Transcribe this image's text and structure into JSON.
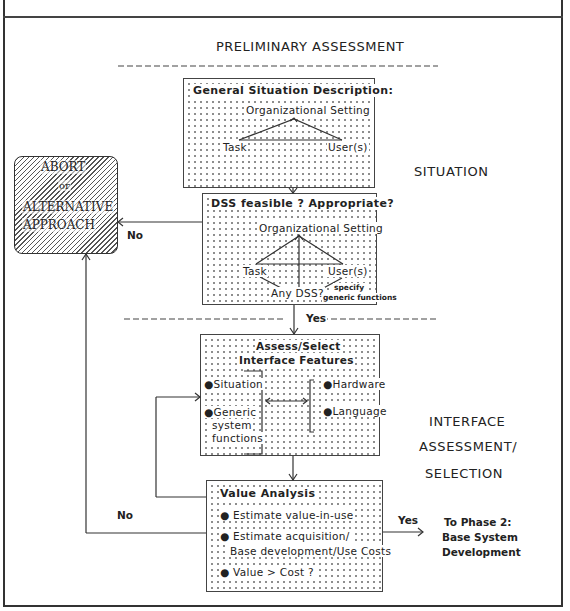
{
  "diagram": {
    "top_header": "PRELIMINARY ASSESSMENT",
    "phase_labels": {
      "situation_line1": "SITUATION",
      "situation_line2": "ANALYSIS",
      "interface_line1": "INTERFACE",
      "interface_line2": "ASSESSMENT/",
      "interface_line3": "SELECTION"
    },
    "box_general": {
      "title": "General Situation Description:",
      "org": "Organizational Setting",
      "task": "Task",
      "users": "User(s)"
    },
    "box_dss": {
      "title": "DSS feasible ? Appropriate?",
      "org": "Organizational Setting",
      "task": "Task",
      "users": "User(s)",
      "any_dss": "Any DSS?",
      "specify_line1": "specify",
      "specify_line2": "generic functions"
    },
    "box_abort": {
      "line1": "ABORT",
      "line2": "or",
      "line3": "ALTERNATIVE",
      "line4": "APPROACH"
    },
    "box_interface": {
      "title_line1": "Assess/Select",
      "title_line2": "Interface Features",
      "left_items": [
        "Situation",
        "Generic",
        "system",
        "functions"
      ],
      "right_items": [
        "Hardware",
        "Language"
      ]
    },
    "box_value": {
      "title": "Value Analysis",
      "items": [
        "Estimate value-in-use",
        "Estimate acquisition/",
        "Base development/Use Costs",
        "Value > Cost ?"
      ]
    },
    "edge_labels": {
      "no_dss": "No",
      "yes_dss": "Yes",
      "no_value": "No",
      "yes_value": "Yes"
    },
    "next_phase": {
      "line1": "To Phase 2:",
      "line2": "Base System",
      "line3": "Development"
    },
    "bullet": "●"
  }
}
